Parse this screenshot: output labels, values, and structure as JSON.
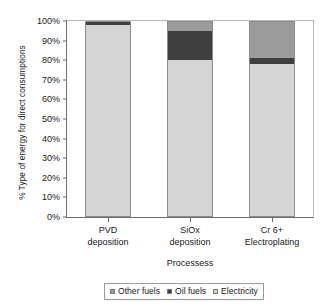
{
  "chart_data": {
    "type": "bar",
    "subtype": "100% stacked column",
    "title": "",
    "xlabel": "Processess",
    "ylabel": "% Type of energy for direct consumptions",
    "categories": [
      "PVD deposition",
      "SiOx deposition",
      "Cr 6+ Electroplating"
    ],
    "category_lines": [
      [
        "PVD",
        "deposition"
      ],
      [
        "SiOx",
        "deposition"
      ],
      [
        "Cr 6+",
        "Electroplating"
      ]
    ],
    "series": [
      {
        "name": "Electricity",
        "color": "#d4d4d4",
        "values": [
          98,
          80,
          78
        ]
      },
      {
        "name": "Oil fuels",
        "color": "#3f3f3f",
        "values": [
          2,
          15,
          3
        ]
      },
      {
        "name": "Other fuels",
        "color": "#9b9b9b",
        "values": [
          0,
          5,
          19
        ]
      }
    ],
    "stack_order_bottom_to_top": [
      "Electricity",
      "Oil fuels",
      "Other fuels"
    ],
    "ylim": [
      0,
      100
    ],
    "ytick_values": [
      0,
      10,
      20,
      30,
      40,
      50,
      60,
      70,
      80,
      90,
      100
    ],
    "ytick_labels": [
      "0%",
      "10%",
      "20%",
      "30%",
      "40%",
      "50%",
      "60%",
      "70%",
      "80%",
      "90%",
      "100%"
    ],
    "gridlines": {
      "enabled": true,
      "values": [
        50
      ],
      "color": "#ffffff"
    },
    "legend": {
      "position": "bottom",
      "entries": [
        {
          "label": "Other fuels",
          "color": "#9b9b9b"
        },
        {
          "label": "Oil fuels",
          "color": "#3f3f3f"
        },
        {
          "label": "Electricity",
          "color": "#d4d4d4"
        }
      ]
    }
  }
}
